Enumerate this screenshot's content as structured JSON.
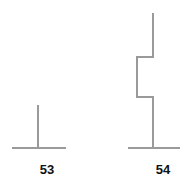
{
  "page": {
    "background_color": "#ffffff",
    "width": 193,
    "height": 187
  },
  "style": {
    "stroke_color": "#9a9a9a",
    "stroke_width": 2,
    "caption_color": "#111111"
  },
  "figures": [
    {
      "id": "figure-53",
      "label": "53",
      "shape": "inverted-t",
      "description": "Vertical stem rising from the centre of a horizontal baseline",
      "baseline": {
        "x1": 12,
        "x2": 66,
        "y": 148
      },
      "points": [
        {
          "x": 38,
          "y": 105
        },
        {
          "x": 38,
          "y": 148
        }
      ]
    },
    {
      "id": "figure-54",
      "label": "54",
      "shape": "zigzag-staircase",
      "description": "Stepped polyline: down, left jog, down, right jog, down to baseline",
      "baseline": {
        "x1": 128,
        "x2": 180,
        "y": 148
      },
      "points": [
        {
          "x": 153,
          "y": 13
        },
        {
          "x": 153,
          "y": 57
        },
        {
          "x": 137,
          "y": 57
        },
        {
          "x": 137,
          "y": 97
        },
        {
          "x": 153,
          "y": 97
        },
        {
          "x": 153,
          "y": 148
        }
      ]
    }
  ]
}
